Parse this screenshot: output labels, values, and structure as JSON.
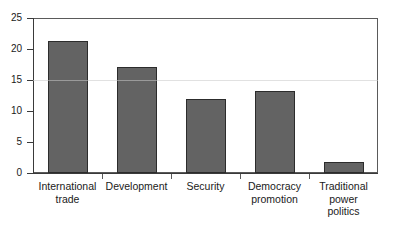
{
  "chart_data": {
    "type": "bar",
    "title": "",
    "subtitle": "",
    "xlabel": "",
    "ylabel": "",
    "categories": [
      "International trade",
      "Development",
      "Security",
      "Democracy promotion",
      "Traditional power politics"
    ],
    "category_lines": [
      [
        "International",
        "trade"
      ],
      [
        "Development"
      ],
      [
        "Security"
      ],
      [
        "Democracy",
        "promotion"
      ],
      [
        "Traditional",
        "power",
        "politics"
      ]
    ],
    "values": [
      21.3,
      17.1,
      11.9,
      13.2,
      1.8
    ],
    "ylim": [
      0,
      25
    ],
    "ytick_values": [
      0,
      5,
      10,
      15,
      20,
      25
    ],
    "ytick_labels": [
      "0",
      "5",
      "10",
      "15",
      "20",
      "25"
    ],
    "grid": false,
    "legend": null,
    "legend_position": "none",
    "annotations": [],
    "bar_color": "#636363",
    "bar_edge_color": "#2c2c2c",
    "axis_color": "#3a3a3a",
    "frame_color": "#5a5a5a",
    "background_color": "#ffffff",
    "text_color": "#1a1a1a"
  }
}
